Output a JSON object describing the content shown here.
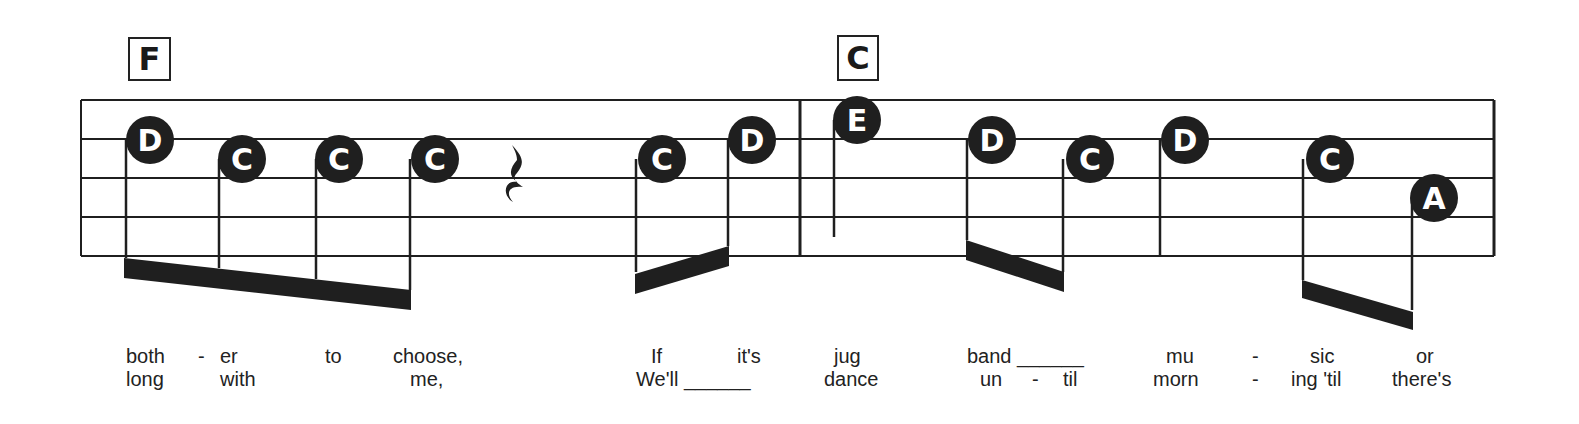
{
  "chords": [
    {
      "label": "F",
      "x": 128,
      "y": 37,
      "w": 43,
      "h": 44
    },
    {
      "label": "C",
      "x": 837,
      "y": 35,
      "w": 42,
      "h": 46
    }
  ],
  "staff": {
    "left": 81,
    "right": 1494,
    "lines_y": [
      100,
      139,
      178,
      217,
      256
    ],
    "barline_x": 800,
    "color": "#222222"
  },
  "notes": [
    {
      "letter": "D",
      "cx": 150,
      "cy": 140,
      "stem_x": 126,
      "stem_end": 258
    },
    {
      "letter": "C",
      "cx": 242,
      "cy": 159,
      "stem_x": 219,
      "stem_end": 268
    },
    {
      "letter": "C",
      "cx": 339,
      "cy": 159,
      "stem_x": 316,
      "stem_end": 279
    },
    {
      "letter": "C",
      "cx": 435,
      "cy": 159,
      "stem_x": 410,
      "stem_end": 290
    },
    {
      "letter": "C",
      "cx": 662,
      "cy": 159,
      "stem_x": 636,
      "stem_end": 272
    },
    {
      "letter": "D",
      "cx": 752,
      "cy": 140,
      "stem_x": 728,
      "stem_end": 246
    },
    {
      "letter": "E",
      "cx": 857,
      "cy": 120,
      "stem_x": 834,
      "stem_end": 237
    },
    {
      "letter": "D",
      "cx": 992,
      "cy": 140,
      "stem_x": 967,
      "stem_end": 240
    },
    {
      "letter": "C",
      "cx": 1090,
      "cy": 159,
      "stem_x": 1063,
      "stem_end": 272
    },
    {
      "letter": "D",
      "cx": 1185,
      "cy": 140,
      "stem_x": 1160,
      "stem_end": 257
    },
    {
      "letter": "C",
      "cx": 1330,
      "cy": 159,
      "stem_x": 1303,
      "stem_end": 280
    },
    {
      "letter": "A",
      "cx": 1434,
      "cy": 198,
      "stem_x": 1412,
      "stem_end": 310
    }
  ],
  "beams": [
    {
      "x1": 124,
      "y1": 258,
      "x2": 411,
      "y2": 290,
      "thickness": 20
    },
    {
      "x1": 635,
      "y1": 274,
      "x2": 729,
      "y2": 246,
      "thickness": 20
    },
    {
      "x1": 966,
      "y1": 240,
      "x2": 1064,
      "y2": 272,
      "thickness": 20
    },
    {
      "x1": 1302,
      "y1": 280,
      "x2": 1413,
      "y2": 312,
      "thickness": 18
    }
  ],
  "rest": {
    "type": "quarter-rest",
    "x": 515,
    "y_top": 145,
    "y_bottom": 202
  },
  "lyrics": {
    "line1": [
      {
        "text": "both",
        "x": 126
      },
      {
        "text": "-",
        "x": 198
      },
      {
        "text": "er",
        "x": 220
      },
      {
        "text": "to",
        "x": 325
      },
      {
        "text": "choose,",
        "x": 393
      },
      {
        "text": "If",
        "x": 651
      },
      {
        "text": "it's",
        "x": 737
      },
      {
        "text": "jug",
        "x": 834
      },
      {
        "text": "band ______",
        "x": 967
      },
      {
        "text": "mu",
        "x": 1166
      },
      {
        "text": "-",
        "x": 1252
      },
      {
        "text": "sic",
        "x": 1310
      },
      {
        "text": "or",
        "x": 1416
      }
    ],
    "line2": [
      {
        "text": "long",
        "x": 126
      },
      {
        "text": "with",
        "x": 220
      },
      {
        "text": "me,",
        "x": 410
      },
      {
        "text": "We'll ______",
        "x": 636
      },
      {
        "text": "dance",
        "x": 824
      },
      {
        "text": "un",
        "x": 980
      },
      {
        "text": "-",
        "x": 1032
      },
      {
        "text": "til",
        "x": 1063
      },
      {
        "text": "morn",
        "x": 1153
      },
      {
        "text": "-",
        "x": 1252
      },
      {
        "text": "ing 'til",
        "x": 1291
      },
      {
        "text": "there's",
        "x": 1392
      }
    ],
    "line1_y": 345,
    "line2_y": 368
  },
  "colors": {
    "ink": "#1f1f1f",
    "paper": "#ffffff",
    "note_text": "#ffffff"
  }
}
